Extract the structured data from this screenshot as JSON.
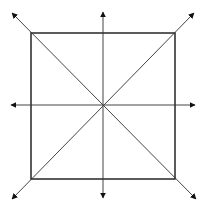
{
  "diagram": {
    "colors": {
      "background": "#ffffff",
      "square_stroke": "#333333",
      "line_stroke": "#444444",
      "arrowhead": "#111111"
    },
    "square": {
      "x": 31,
      "y": 33,
      "width": 144,
      "height": 146
    },
    "center": {
      "x": 103,
      "y": 105
    },
    "arrows": [
      {
        "name": "horizontal",
        "from": [
          11,
          105
        ],
        "to": [
          195,
          105
        ]
      },
      {
        "name": "vertical",
        "from": [
          103,
          12
        ],
        "to": [
          103,
          198
        ]
      },
      {
        "name": "diagonal-main",
        "from": [
          12,
          13
        ],
        "to": [
          196,
          199
        ]
      },
      {
        "name": "diagonal-anti",
        "from": [
          194,
          13
        ],
        "to": [
          12,
          199
        ]
      }
    ]
  }
}
